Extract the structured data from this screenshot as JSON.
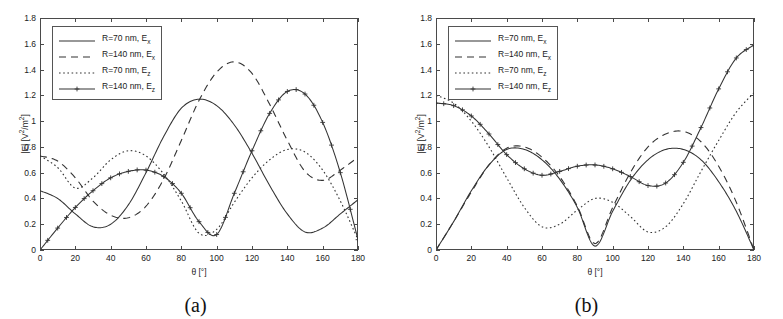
{
  "figure": {
    "panels": [
      {
        "id": "a",
        "sublabel": "(a)"
      },
      {
        "id": "b",
        "sublabel": "(b)"
      }
    ]
  },
  "axis": {
    "ylabel_main": "|E| [V",
    "ylabel_sup1": "2",
    "ylabel_mid": "/m",
    "ylabel_sup2": "2",
    "ylabel_end": "]",
    "ylabel_plain": "|E| [V2/m2]",
    "xlabel_theta": "θ [°]",
    "yticks": [
      "0",
      "0.2",
      "0.4",
      "0.6",
      "0.8",
      "1",
      "1.2",
      "1.4",
      "1.6",
      "1.8"
    ],
    "xticks": [
      "0",
      "20",
      "40",
      "60",
      "80",
      "100",
      "120",
      "140",
      "160",
      "180"
    ],
    "ylim": [
      0,
      1.8
    ],
    "xlim": [
      0,
      180
    ]
  },
  "legend": {
    "entries": [
      {
        "label": "R=70 nm, E",
        "sub": "x",
        "style": "solid"
      },
      {
        "label": "R=140 nm, E",
        "sub": "x",
        "style": "dashed"
      },
      {
        "label": "R=70 nm, E",
        "sub": "z",
        "style": "dotted"
      },
      {
        "label": "R=140 nm, E",
        "sub": "z",
        "style": "plus"
      }
    ]
  },
  "chart_data": [
    {
      "type": "line",
      "panel": "a",
      "title": "(a)",
      "xlabel": "θ [°]",
      "ylabel": "|E| [V2/m2]",
      "xlim": [
        0,
        180
      ],
      "ylim": [
        0,
        1.8
      ],
      "grid": false,
      "legend_position": "upper-left",
      "x": [
        0,
        10,
        20,
        30,
        40,
        50,
        60,
        70,
        80,
        90,
        100,
        110,
        120,
        130,
        140,
        150,
        160,
        170,
        180
      ],
      "series": [
        {
          "name": "R=70 nm, Ex",
          "style": "solid",
          "values": [
            0.46,
            0.4,
            0.28,
            0.18,
            0.2,
            0.35,
            0.6,
            0.88,
            1.1,
            1.17,
            1.12,
            0.97,
            0.75,
            0.5,
            0.28,
            0.14,
            0.17,
            0.28,
            0.39
          ]
        },
        {
          "name": "R=140 nm, Ex",
          "style": "dashed",
          "values": [
            0.73,
            0.69,
            0.56,
            0.38,
            0.27,
            0.25,
            0.34,
            0.55,
            0.85,
            1.16,
            1.38,
            1.46,
            1.37,
            1.13,
            0.85,
            0.61,
            0.54,
            0.62,
            0.72
          ]
        },
        {
          "name": "R=70 nm, Ez",
          "style": "dotted",
          "values": [
            0.73,
            0.64,
            0.48,
            0.56,
            0.7,
            0.77,
            0.73,
            0.59,
            0.38,
            0.13,
            0.16,
            0.37,
            0.56,
            0.7,
            0.78,
            0.76,
            0.62,
            0.38,
            0.08
          ]
        },
        {
          "name": "R=140 nm, Ez",
          "style": "plus",
          "values": [
            0.0,
            0.17,
            0.33,
            0.46,
            0.56,
            0.61,
            0.62,
            0.57,
            0.44,
            0.22,
            0.12,
            0.44,
            0.77,
            1.06,
            1.23,
            1.21,
            0.99,
            0.6,
            0.08
          ]
        }
      ]
    },
    {
      "type": "line",
      "panel": "b",
      "title": "(b)",
      "xlabel": "θ [°]",
      "ylabel": "|E| [V2/m2]",
      "xlim": [
        0,
        180
      ],
      "ylim": [
        0,
        1.8
      ],
      "grid": false,
      "legend_position": "upper-left",
      "x": [
        0,
        10,
        20,
        30,
        40,
        50,
        60,
        70,
        80,
        90,
        100,
        110,
        120,
        130,
        140,
        150,
        160,
        170,
        180
      ],
      "series": [
        {
          "name": "R=70 nm, Ex",
          "style": "solid",
          "values": [
            0.0,
            0.22,
            0.46,
            0.66,
            0.78,
            0.78,
            0.7,
            0.55,
            0.33,
            0.03,
            0.3,
            0.54,
            0.7,
            0.78,
            0.78,
            0.7,
            0.53,
            0.3,
            0.0
          ]
        },
        {
          "name": "R=140 nm, Ex",
          "style": "dashed",
          "values": [
            0.0,
            0.22,
            0.45,
            0.66,
            0.79,
            0.8,
            0.72,
            0.57,
            0.34,
            0.05,
            0.33,
            0.6,
            0.8,
            0.9,
            0.92,
            0.84,
            0.65,
            0.37,
            0.0
          ]
        },
        {
          "name": "R=70 nm, Ez",
          "style": "dotted",
          "values": [
            1.2,
            1.14,
            1.0,
            0.8,
            0.56,
            0.33,
            0.18,
            0.2,
            0.31,
            0.4,
            0.37,
            0.26,
            0.14,
            0.18,
            0.36,
            0.61,
            0.85,
            1.07,
            1.22
          ]
        },
        {
          "name": "R=140 nm, Ez",
          "style": "plus",
          "values": [
            1.14,
            1.12,
            1.04,
            0.9,
            0.74,
            0.63,
            0.58,
            0.61,
            0.65,
            0.66,
            0.63,
            0.57,
            0.5,
            0.52,
            0.68,
            0.95,
            1.25,
            1.49,
            1.59
          ]
        }
      ]
    }
  ]
}
